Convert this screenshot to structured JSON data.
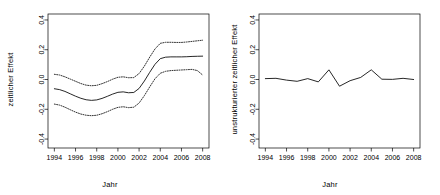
{
  "figure": {
    "background": "#ffffff",
    "line_color": "#000000",
    "axis_color": "#000000"
  },
  "panels": [
    {
      "name": "strukturierter-zeitlicher-effekt",
      "ylabel": "zeitlicher Effekt",
      "xlabel": "Jahr"
    },
    {
      "name": "unstrukturierter-zeitlicher-effekt",
      "ylabel": "unstrukturierter zeitlicher Effekt",
      "xlabel": "Jahr"
    }
  ],
  "chart_data": [
    {
      "type": "line",
      "title": "",
      "xlabel": "Jahr",
      "ylabel": "zeitlicher Effekt",
      "xlim": [
        1993.4,
        2008.6
      ],
      "ylim": [
        -0.46,
        0.44
      ],
      "xticks": [
        1994,
        1996,
        1998,
        2000,
        2002,
        2004,
        2006,
        2008
      ],
      "xticklabels": [
        "1994",
        "1996",
        "1998",
        "2000",
        "2002",
        "2004",
        "2006",
        "2008"
      ],
      "yticks": [
        -0.4,
        -0.2,
        0.0,
        0.2,
        0.4
      ],
      "yticklabels": [
        "-0.4",
        "-0.2",
        "0.0",
        "0.2",
        "0.4"
      ],
      "grid": false,
      "legend": null,
      "x": [
        1994,
        1994.5,
        1995,
        1995.5,
        1996,
        1996.5,
        1997,
        1997.5,
        1998,
        1998.5,
        1999,
        1999.5,
        2000,
        2000.5,
        2001,
        2001.5,
        2002,
        2002.5,
        2003,
        2003.5,
        2004,
        2004.5,
        2005,
        2005.5,
        2006,
        2006.5,
        2007,
        2007.5,
        2008
      ],
      "series": [
        {
          "name": "upper",
          "style": "dotted",
          "values": [
            0.035,
            0.03,
            0.018,
            0.003,
            -0.012,
            -0.027,
            -0.038,
            -0.042,
            -0.039,
            -0.028,
            -0.014,
            0.002,
            0.015,
            0.018,
            0.012,
            0.013,
            0.04,
            0.09,
            0.15,
            0.205,
            0.243,
            0.25,
            0.25,
            0.249,
            0.249,
            0.252,
            0.256,
            0.26,
            0.264
          ]
        },
        {
          "name": "mean",
          "style": "solid",
          "values": [
            -0.062,
            -0.068,
            -0.08,
            -0.096,
            -0.112,
            -0.126,
            -0.136,
            -0.14,
            -0.137,
            -0.127,
            -0.113,
            -0.098,
            -0.086,
            -0.083,
            -0.089,
            -0.087,
            -0.06,
            -0.01,
            0.048,
            0.102,
            0.14,
            0.15,
            0.152,
            0.152,
            0.152,
            0.153,
            0.155,
            0.156,
            0.157
          ]
        },
        {
          "name": "lower",
          "style": "dotted",
          "values": [
            -0.165,
            -0.172,
            -0.186,
            -0.203,
            -0.219,
            -0.232,
            -0.24,
            -0.243,
            -0.24,
            -0.23,
            -0.216,
            -0.2,
            -0.187,
            -0.183,
            -0.189,
            -0.186,
            -0.158,
            -0.108,
            -0.05,
            0.005,
            0.042,
            0.055,
            0.06,
            0.062,
            0.064,
            0.066,
            0.068,
            0.06,
            0.03
          ]
        }
      ]
    },
    {
      "type": "line",
      "title": "",
      "xlabel": "Jahr",
      "ylabel": "unstrukturierter zeitlicher Effekt",
      "xlim": [
        1993.4,
        2008.6
      ],
      "ylim": [
        -0.46,
        0.44
      ],
      "xticks": [
        1994,
        1996,
        1998,
        2000,
        2002,
        2004,
        2006,
        2008
      ],
      "xticklabels": [
        "1994",
        "1996",
        "1998",
        "2000",
        "2002",
        "2004",
        "2006",
        "2008"
      ],
      "yticks": [
        -0.4,
        -0.2,
        0.0,
        0.2,
        0.4
      ],
      "yticklabels": [
        "-0.4",
        "-0.2",
        "0.0",
        "0.2",
        "0.4"
      ],
      "grid": false,
      "legend": null,
      "x": [
        1994,
        1995,
        1996,
        1997,
        1998,
        1999,
        2000,
        2001,
        2002,
        2003,
        2004,
        2005,
        2006,
        2007,
        2008
      ],
      "series": [
        {
          "name": "unstructured",
          "style": "solid",
          "values": [
            0.006,
            0.008,
            -0.004,
            -0.012,
            0.006,
            -0.016,
            0.065,
            -0.045,
            -0.008,
            0.014,
            0.065,
            0.002,
            0.001,
            0.008,
            0.0
          ]
        }
      ]
    }
  ]
}
